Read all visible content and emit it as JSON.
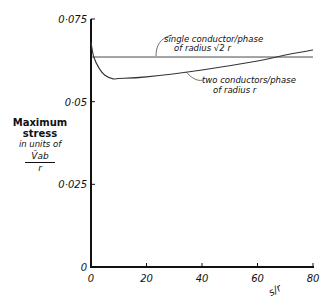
{
  "chart_data": {
    "type": "line",
    "title": "",
    "xlabel": "s/r",
    "ylabel": "Maximum stress in units of V̂ab / r",
    "xlim": [
      0,
      80
    ],
    "ylim": [
      0,
      0.075
    ],
    "grid": false,
    "x_ticks": [
      "0",
      "20",
      "40",
      "60",
      "80"
    ],
    "y_ticks": [
      "0",
      "0·025",
      "0·05",
      "0·075"
    ],
    "series": [
      {
        "name": "single conductor/phase of radius √2 r",
        "x": [
          0,
          80
        ],
        "values": [
          0.0635,
          0.0635
        ]
      },
      {
        "name": "two conductors/phase of radius r",
        "x": [
          0,
          1,
          3,
          5,
          8,
          10,
          20,
          40,
          60,
          70,
          80
        ],
        "values": [
          0.068,
          0.0635,
          0.06,
          0.058,
          0.0569,
          0.057,
          0.0575,
          0.0596,
          0.0623,
          0.0641,
          0.0656
        ]
      }
    ],
    "annotations": [
      {
        "text_line1": "single conductor/phase",
        "text_line2": "of radius √2 r"
      },
      {
        "text_line1": "two conductors/phase",
        "text_line2": "of radius r"
      }
    ]
  },
  "axis": {
    "x_label": "s/r",
    "y_label_title_1": "Maximum",
    "y_label_title_2": "stress",
    "y_label_units": "in units of",
    "y_label_num": "V̂ab",
    "y_label_den": "r"
  }
}
